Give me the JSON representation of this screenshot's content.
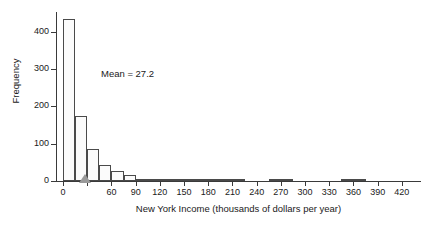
{
  "chart_data": {
    "type": "bar",
    "title": "",
    "subtitle": "",
    "xlabel": "New York Income (thousands of dollars per year)",
    "ylabel": "Frequency",
    "xlim": [
      -7.5,
      442.5
    ],
    "ylim": [
      0,
      450
    ],
    "bin_width": 15,
    "grid": false,
    "legend": null,
    "x_ticks": [
      0,
      30,
      60,
      90,
      120,
      150,
      180,
      210,
      240,
      270,
      300,
      330,
      360,
      390,
      420
    ],
    "x_tick_labels": [
      "0",
      "",
      "60",
      "90",
      "120",
      "150",
      "180",
      "210",
      "240",
      "270",
      "300",
      "330",
      "360",
      "390",
      "420"
    ],
    "y_ticks": [
      0,
      100,
      200,
      300,
      400
    ],
    "y_tick_labels": [
      "0",
      "100",
      "200",
      "300",
      "400"
    ],
    "bin_starts": [
      0,
      15,
      30,
      45,
      60,
      75,
      90,
      105,
      120,
      135,
      150,
      165,
      180,
      195,
      210,
      225,
      240,
      255,
      270,
      285,
      300,
      315,
      330,
      345,
      360,
      375,
      390,
      405,
      420,
      435
    ],
    "values": [
      435,
      174,
      85,
      44,
      26,
      15,
      3,
      6,
      6,
      2,
      3,
      3,
      3,
      3,
      3,
      0,
      0,
      6,
      6,
      0,
      0,
      0,
      0,
      2,
      2
    ],
    "annotations": [
      {
        "name": "mean-label",
        "text": "Mean = 27.2",
        "x": 75,
        "y": 285
      }
    ],
    "markers": [
      {
        "name": "mean-marker",
        "shape": "triangle",
        "x": 27.2,
        "y": 0,
        "color": "#9a9a9a"
      }
    ],
    "bar_fill": "#fbfbfb",
    "bar_stroke": "#4a4a4a",
    "axis_color": "#3a3a3a"
  }
}
